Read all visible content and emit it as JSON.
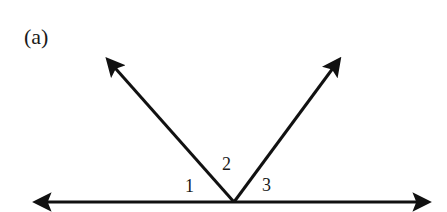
{
  "figure": {
    "panel_label": "(a)",
    "angle_labels": [
      "1",
      "2",
      "3"
    ],
    "colors": {
      "line": "#111111",
      "background": "#ffffff"
    }
  }
}
